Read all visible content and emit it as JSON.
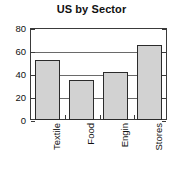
{
  "chart_data": {
    "type": "bar",
    "title": "US by Sector",
    "xlabel": "",
    "ylabel": "",
    "categories": [
      "Textile",
      "Food",
      "Engin",
      "Stores"
    ],
    "values": [
      52,
      35,
      42,
      65
    ],
    "ylim": [
      0,
      80
    ],
    "yticks": [
      0,
      20,
      40,
      60,
      80
    ],
    "ytick_labels": [
      "0",
      "20",
      "40",
      "60",
      "80"
    ],
    "grid": true,
    "legend": "none",
    "bar_fill_color": "#d2d2d2",
    "bar_edge_color": "#2b2b2b",
    "axis_color": "#3a3a3a",
    "text_color": "#111111",
    "background_color": "#ffffff",
    "label_rotation": -90
  }
}
